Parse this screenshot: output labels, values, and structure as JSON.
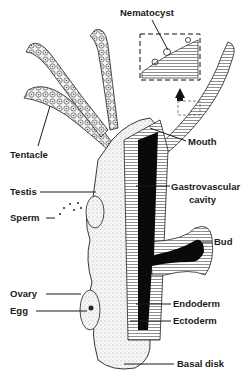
{
  "diagram": {
    "colors": {
      "background": "#ffffff",
      "ink": "#1a1a1a",
      "cavity": "#0a0a0a",
      "body_stipple": "#f2f2f2"
    },
    "labels": {
      "nematocyst": "Nematocyst",
      "tentacle": "Tentacle",
      "mouth": "Mouth",
      "testis": "Testis",
      "gastrovascular_line1": "Gastrovascular",
      "gastrovascular_line2": "cavity",
      "sperm": "Sperm",
      "bud": "Bud",
      "ovary": "Ovary",
      "egg": "Egg",
      "endoderm": "Endoderm",
      "ectoderm": "Ectoderm",
      "basal_disk": "Basal disk"
    }
  }
}
